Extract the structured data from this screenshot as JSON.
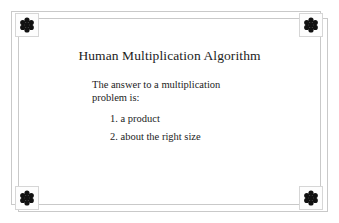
{
  "slide": {
    "title": "Human Multiplication Algorithm",
    "body": {
      "line1": "The answer to a multiplication",
      "line2": "problem is:"
    },
    "list": [
      {
        "marker": "1.",
        "text": "a product",
        "full": "1. a product"
      },
      {
        "marker": "2.",
        "text": "about the right size",
        "full": "2. about the right size"
      }
    ],
    "decorations": {
      "corner_ornament_icon": "six-petal-flower-icon",
      "corner_count": 4,
      "frame_style": "double-offset-rectangle"
    },
    "colors": {
      "background": "#ffffff",
      "text": "#1c1c1c",
      "frame_line": "#c9c9c9",
      "ornament": "#111111",
      "ornament_box_border": "#d6d6d6"
    }
  }
}
